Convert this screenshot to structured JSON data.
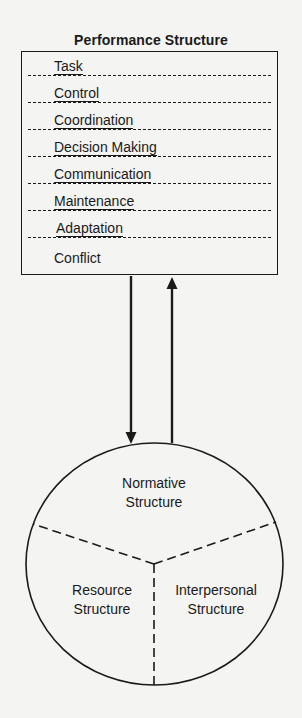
{
  "performance_structure": {
    "title": "Performance Structure",
    "items": [
      {
        "label": "Task"
      },
      {
        "label": "Control"
      },
      {
        "label": "Coordination"
      },
      {
        "label": "Decision Making"
      },
      {
        "label": "Communication"
      },
      {
        "label": "Maintenance"
      },
      {
        "label": "Adaptation"
      },
      {
        "label": "Conflict"
      }
    ]
  },
  "arrows": {
    "down": "performance-to-circle",
    "up": "circle-to-performance"
  },
  "circle": {
    "sections": {
      "top": {
        "line1": "Normative",
        "line2": "Structure"
      },
      "left": {
        "line1": "Resource",
        "line2": "Structure"
      },
      "right": {
        "line1": "Interpersonal",
        "line2": "Structure"
      }
    }
  },
  "colors": {
    "ink": "#1a1a1a",
    "paper": "#f4f4f2"
  }
}
